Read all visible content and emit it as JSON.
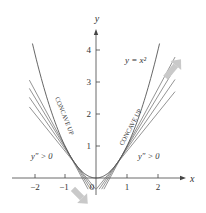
{
  "figure": {
    "curve_label": "y = x²",
    "axis_x_label": "x",
    "axis_y_label": "y",
    "x_ticks": [
      "−2",
      "−1",
      "0",
      "1",
      "2"
    ],
    "y_ticks": [
      "1",
      "2",
      "3",
      "4"
    ],
    "left_region_label": "CONCAVE UP",
    "right_region_label": "CONCAVE UP",
    "left_condition": "y″ > 0",
    "right_condition": "y″ > 0",
    "colors": {
      "curve": "#555555",
      "axis": "#444444",
      "arrow": "#c8c8c8"
    }
  },
  "chart_data": {
    "type": "line",
    "title": "",
    "function": "y = x^2",
    "xlabel": "x",
    "ylabel": "y",
    "xlim": [
      -2.5,
      2.6
    ],
    "ylim": [
      -0.5,
      4.5
    ],
    "x_ticks": [
      -2,
      -1,
      0,
      1,
      2
    ],
    "y_ticks": [
      1,
      2,
      3,
      4
    ],
    "tangent_points_left": [
      -0.6,
      -0.7,
      -0.8,
      -0.9
    ],
    "tangent_points_right": [
      0.6,
      0.7,
      0.8,
      0.9
    ],
    "annotations": [
      "CONCAVE UP",
      "CONCAVE UP",
      "y'' > 0",
      "y'' > 0"
    ]
  }
}
